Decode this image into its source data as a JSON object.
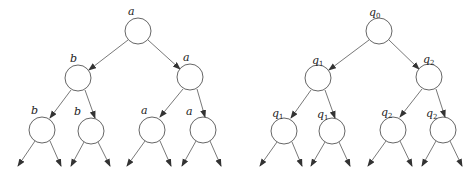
{
  "diagram": {
    "trees": [
      {
        "name": "left-tree",
        "nodes": [
          {
            "id": "root",
            "label": "a",
            "cx": 138,
            "cy": 31
          },
          {
            "id": "l",
            "label": "b",
            "cx": 78,
            "cy": 78
          },
          {
            "id": "r",
            "label": "a",
            "cx": 190,
            "cy": 77
          },
          {
            "id": "ll",
            "label": "b",
            "cx": 42,
            "cy": 130
          },
          {
            "id": "lr",
            "label": "b",
            "cx": 91,
            "cy": 131
          },
          {
            "id": "rl",
            "label": "a",
            "cx": 152,
            "cy": 130
          },
          {
            "id": "rr",
            "label": "a",
            "cx": 203,
            "cy": 130
          }
        ]
      },
      {
        "name": "right-tree",
        "nodes": [
          {
            "id": "root",
            "label": "q",
            "sub": "0",
            "cx": 379,
            "cy": 31
          },
          {
            "id": "l",
            "label": "q",
            "sub": "1",
            "cx": 318,
            "cy": 78
          },
          {
            "id": "r",
            "label": "q",
            "sub": "2",
            "cx": 429,
            "cy": 77
          },
          {
            "id": "ll",
            "label": "q",
            "sub": "1",
            "cx": 284,
            "cy": 131
          },
          {
            "id": "lr",
            "label": "q",
            "sub": "1",
            "cx": 332,
            "cy": 131
          },
          {
            "id": "rl",
            "label": "q",
            "sub": "2",
            "cx": 393,
            "cy": 130
          },
          {
            "id": "rr",
            "label": "q",
            "sub": "2",
            "cx": 443,
            "cy": 130
          }
        ]
      }
    ],
    "labels": {
      "left": {
        "root": "a",
        "l": "b",
        "r": "a",
        "ll": "b",
        "lr": "b",
        "rl": "a",
        "rr": "a"
      },
      "right": {
        "root": "q",
        "root_sub": "0",
        "l": "q",
        "l_sub": "1",
        "r": "q",
        "r_sub": "2",
        "ll": "q",
        "ll_sub": "1",
        "lr": "q",
        "lr_sub": "1",
        "rl": "q",
        "rl_sub": "2",
        "rr": "q",
        "rr_sub": "2"
      }
    },
    "node_radius": 13,
    "stroke_color": "#555555"
  }
}
